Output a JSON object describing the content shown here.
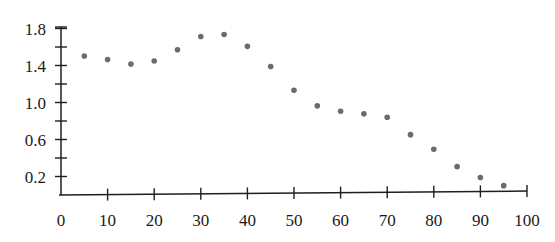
{
  "chart_data": {
    "type": "scatter",
    "title": "",
    "xlabel": "",
    "ylabel": "",
    "xlim": [
      0,
      100
    ],
    "ylim": [
      0,
      1.8
    ],
    "grid": false,
    "legend": null,
    "x_ticks": [
      0,
      10,
      20,
      30,
      40,
      50,
      60,
      70,
      80,
      90,
      100
    ],
    "x_tick_labels": [
      "0",
      "10",
      "20",
      "30",
      "40",
      "50",
      "60",
      "70",
      "80",
      "90",
      "100"
    ],
    "y_ticks_labeled": [
      0.2,
      0.6,
      1.0,
      1.4,
      1.8
    ],
    "y_tick_labels": [
      "0.2",
      "0.6",
      "1.0",
      "1.4",
      "1.8"
    ],
    "y_ticks_minor": [
      0.4,
      0.8,
      1.2,
      1.6
    ],
    "series": [
      {
        "name": "data",
        "color": "#6b6b6b",
        "x": [
          5,
          10,
          15,
          20,
          25,
          30,
          35,
          40,
          45,
          50,
          55,
          60,
          65,
          70,
          75,
          80,
          85,
          90,
          95
        ],
        "y": [
          1.5,
          1.46,
          1.41,
          1.44,
          1.56,
          1.7,
          1.72,
          1.59,
          1.37,
          1.11,
          0.94,
          0.88,
          0.85,
          0.81,
          0.62,
          0.46,
          0.27,
          0.15,
          0.06
        ]
      }
    ]
  }
}
